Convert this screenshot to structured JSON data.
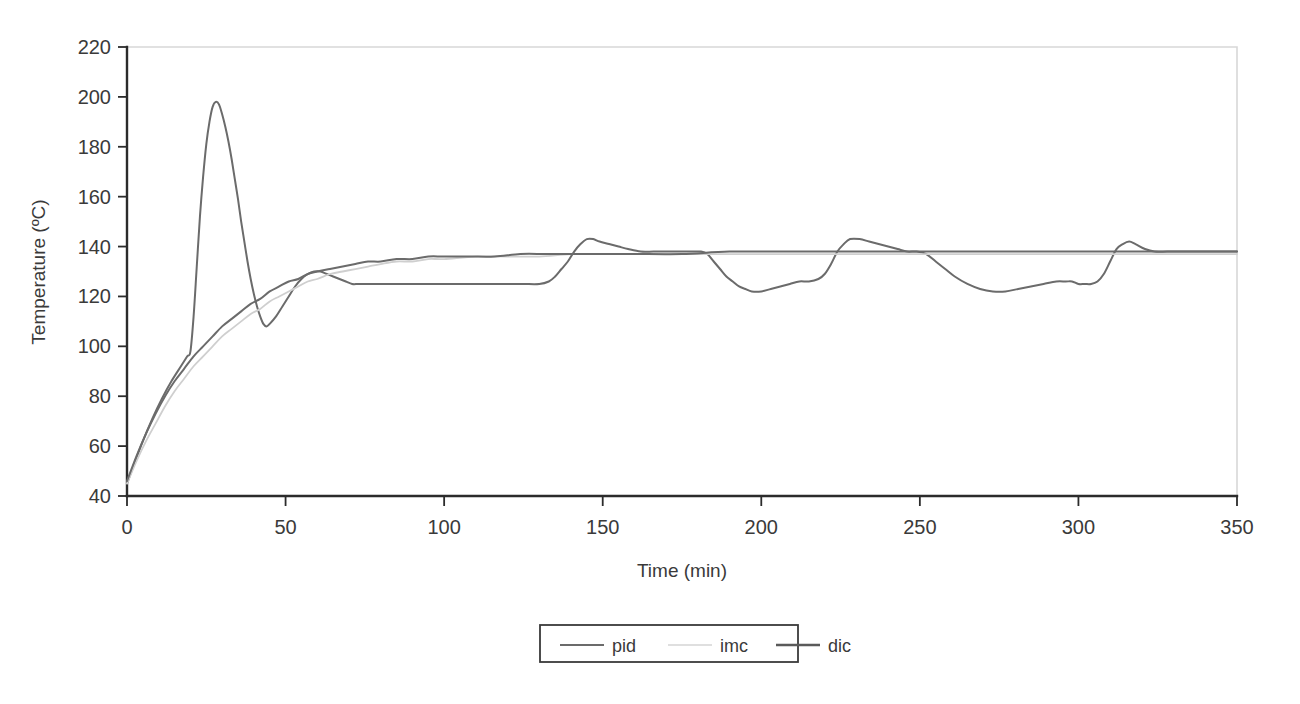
{
  "chart_data": {
    "type": "line",
    "title": "",
    "xlabel": "Time (min)",
    "ylabel": "Temperature (ºC)",
    "xlim": [
      0,
      350
    ],
    "ylim": [
      40,
      220
    ],
    "xticks": [
      0,
      50,
      100,
      150,
      200,
      250,
      300,
      350
    ],
    "yticks": [
      40,
      60,
      80,
      100,
      120,
      140,
      160,
      180,
      200,
      220
    ],
    "grid": false,
    "legend_position": "below-center",
    "setpoint": 138,
    "series": [
      {
        "name": "pid",
        "color": "#6b6b6b",
        "width": 2.0,
        "x": [
          0,
          2,
          5,
          8,
          11,
          14,
          17,
          19,
          20,
          21,
          22,
          23,
          24,
          25,
          26,
          27,
          28,
          29,
          30,
          31,
          32,
          33,
          34,
          35,
          36,
          37,
          38,
          39,
          40,
          41,
          42,
          43,
          44,
          45,
          47,
          49,
          51,
          53,
          55,
          57,
          59,
          61,
          63,
          65,
          67,
          69,
          71,
          73,
          76,
          80,
          85,
          90,
          95,
          100,
          105,
          110,
          115,
          120,
          125,
          130,
          133,
          135,
          137,
          139,
          141,
          143,
          145,
          147,
          149,
          152,
          155,
          158,
          162,
          166,
          170,
          174,
          178,
          181,
          183,
          185,
          187,
          189,
          191,
          193,
          195,
          197,
          200,
          203,
          206,
          209,
          212,
          215,
          218,
          220,
          222,
          224,
          226,
          228,
          231,
          234,
          237,
          240,
          243,
          246,
          249,
          252,
          255,
          258,
          261,
          265,
          269,
          273,
          277,
          281,
          285,
          289,
          293,
          296,
          298,
          300,
          302,
          304,
          306,
          308,
          310,
          312,
          314,
          316,
          318,
          321,
          324,
          328,
          332,
          336,
          340,
          345,
          350
        ],
        "y": [
          45,
          52,
          62,
          71,
          79,
          86,
          92,
          96,
          98,
          112,
          132,
          152,
          168,
          181,
          190,
          196,
          198,
          197,
          193,
          188,
          182,
          175,
          167,
          159,
          150,
          142,
          134,
          127,
          121,
          116,
          112,
          109,
          108,
          109,
          112,
          116,
          120,
          124,
          127,
          129,
          130,
          130,
          129,
          128,
          127,
          126,
          125,
          125,
          125,
          125,
          125,
          125,
          125,
          125,
          125,
          125,
          125,
          125,
          125,
          125,
          126,
          128,
          131,
          134,
          138,
          141,
          143,
          143,
          142,
          141,
          140,
          139,
          138,
          138,
          138,
          138,
          138,
          138,
          137,
          134,
          131,
          128,
          126,
          124,
          123,
          122,
          122,
          123,
          124,
          125,
          126,
          126,
          127,
          129,
          133,
          138,
          141,
          143,
          143,
          142,
          141,
          140,
          139,
          138,
          138,
          137,
          134,
          131,
          128,
          125,
          123,
          122,
          122,
          123,
          124,
          125,
          126,
          126,
          126,
          125,
          125,
          125,
          126,
          129,
          134,
          139,
          141,
          142,
          141,
          139,
          138,
          138,
          138,
          138,
          138,
          138,
          138
        ]
      },
      {
        "name": "imc",
        "color": "#cfcfcf",
        "width": 1.8,
        "x": [
          0,
          3,
          6,
          9,
          12,
          15,
          18,
          21,
          24,
          27,
          30,
          33,
          36,
          39,
          42,
          45,
          48,
          51,
          54,
          57,
          60,
          64,
          68,
          72,
          76,
          80,
          85,
          90,
          95,
          100,
          110,
          120,
          130,
          140,
          150,
          165,
          180,
          200,
          220,
          240,
          260,
          280,
          300,
          320,
          350
        ],
        "y": [
          45,
          54,
          62,
          69,
          76,
          82,
          87,
          92,
          96,
          100,
          104,
          107,
          110,
          113,
          115,
          118,
          120,
          122,
          124,
          126,
          127,
          129,
          130,
          131,
          132,
          133,
          134,
          134,
          135,
          135,
          136,
          136,
          136,
          137,
          137,
          137,
          137,
          137,
          137,
          137,
          137,
          137,
          137,
          137,
          137
        ]
      },
      {
        "name": "dic",
        "color": "#6b6b6b",
        "width": 2.0,
        "x": [
          0,
          3,
          6,
          9,
          12,
          15,
          18,
          21,
          24,
          27,
          30,
          33,
          36,
          39,
          42,
          45,
          48,
          51,
          54,
          57,
          60,
          64,
          68,
          72,
          76,
          80,
          85,
          90,
          95,
          100,
          108,
          116,
          124,
          132,
          140,
          150,
          160,
          175,
          190,
          210,
          230,
          250,
          270,
          290,
          310,
          330,
          350
        ],
        "y": [
          46,
          56,
          65,
          73,
          80,
          86,
          91,
          96,
          100,
          104,
          108,
          111,
          114,
          117,
          119,
          122,
          124,
          126,
          127,
          129,
          130,
          131,
          132,
          133,
          134,
          134,
          135,
          135,
          136,
          136,
          136,
          136,
          137,
          137,
          137,
          137,
          137,
          137,
          138,
          138,
          138,
          138,
          138,
          138,
          138,
          138,
          138
        ]
      }
    ],
    "legend": [
      {
        "label": "pid",
        "color": "#6b6b6b",
        "width": 2.0
      },
      {
        "label": "imc",
        "color": "#d4d4d4",
        "width": 1.6
      },
      {
        "label": "dic",
        "color": "#5a5a5a",
        "width": 2.4
      }
    ]
  },
  "axes": {
    "y_tick_labels": [
      "220",
      "200",
      "180",
      "160",
      "140",
      "120",
      "100",
      "80",
      "60",
      "40"
    ],
    "x_tick_labels": [
      "0",
      "50",
      "100",
      "150",
      "200",
      "250",
      "300",
      "350"
    ],
    "x_axis_title": "Time (min)",
    "y_axis_title": "Temperature (ºC)"
  }
}
